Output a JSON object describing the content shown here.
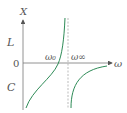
{
  "diagram": {
    "y_axis_label": "X",
    "x_axis_label": "ω",
    "upper_region_label": "L",
    "lower_region_label": "C",
    "origin_label": "0",
    "resonance_label": "ω₀",
    "antiresonance_label": "ω∞",
    "colors": {
      "curve": "#2e8b57",
      "axis": "#555555",
      "asymptote": "#aaaaaa"
    }
  }
}
